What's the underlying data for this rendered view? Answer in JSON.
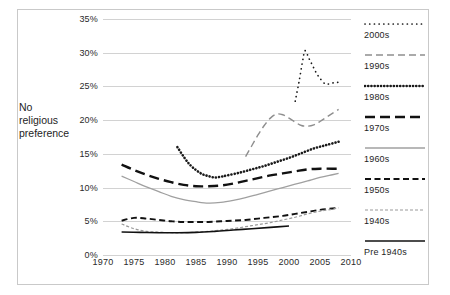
{
  "axis_title": [
    "No",
    "religious",
    "preference"
  ],
  "chart_data": {
    "type": "line",
    "title": "",
    "xlabel": "",
    "ylabel": "No religious preference",
    "xlim": [
      1970,
      2010
    ],
    "ylim": [
      0,
      35
    ],
    "xticks": [
      "1970",
      "1975",
      "1980",
      "1985",
      "1990",
      "1995",
      "2000",
      "2005",
      "2010"
    ],
    "yticks": [
      "0%",
      "5%",
      "10%",
      "15%",
      "20%",
      "25%",
      "30%",
      "35%"
    ],
    "grid": true,
    "legend_position": "right",
    "series": [
      {
        "name": "2000s",
        "style": "fine-dotted",
        "color": "#1a1a1a",
        "x": [
          2001,
          2001.6,
          2002.2,
          2002.6,
          2003.2,
          2003.8,
          2004.4,
          2005,
          2005.8,
          2006.6,
          2007.4,
          2008
        ],
        "y": [
          22.8,
          25.6,
          28.8,
          30.3,
          29.2,
          28.1,
          27.0,
          26.2,
          25.4,
          25.4,
          25.6,
          25.6
        ]
      },
      {
        "name": "1990s",
        "style": "long-dash-gray",
        "color": "#8e8e8e",
        "x": [
          1993,
          1994,
          1995,
          1996,
          1997,
          1998,
          1999,
          2000,
          2001,
          2002,
          2003,
          2004,
          2005,
          2006,
          2007,
          2008
        ],
        "y": [
          14.6,
          16.2,
          17.8,
          19.2,
          20.3,
          20.9,
          20.8,
          20.3,
          19.7,
          19.2,
          19.1,
          19.3,
          19.8,
          20.4,
          21.0,
          21.6
        ]
      },
      {
        "name": "1980s",
        "style": "bold-dotted",
        "color": "#1a1a1a",
        "x": [
          1982,
          1983,
          1984,
          1985,
          1986,
          1987,
          1988,
          1989,
          1990,
          1992,
          1994,
          1996,
          1998,
          2000,
          2002,
          2004,
          2006,
          2008
        ],
        "y": [
          16.0,
          14.6,
          13.4,
          12.6,
          12.0,
          11.7,
          11.5,
          11.6,
          11.8,
          12.2,
          12.7,
          13.2,
          13.8,
          14.4,
          15.1,
          15.8,
          16.3,
          16.8
        ]
      },
      {
        "name": "1970s",
        "style": "long-dash-black",
        "color": "#111111",
        "x": [
          1973,
          1975,
          1977,
          1979,
          1981,
          1983,
          1985,
          1987,
          1989,
          1991,
          1993,
          1995,
          1997,
          1999,
          2001,
          2003,
          2005,
          2007,
          2008
        ],
        "y": [
          13.4,
          12.6,
          11.9,
          11.3,
          10.8,
          10.4,
          10.2,
          10.2,
          10.3,
          10.6,
          11.0,
          11.4,
          11.8,
          12.1,
          12.4,
          12.7,
          12.8,
          12.8,
          12.8
        ]
      },
      {
        "name": "1960s",
        "style": "thin-solid-gray",
        "color": "#a0a0a0",
        "x": [
          1973,
          1975,
          1977,
          1979,
          1981,
          1983,
          1985,
          1987,
          1989,
          1991,
          1993,
          1995,
          1997,
          1999,
          2001,
          2003,
          2005,
          2007,
          2008
        ],
        "y": [
          11.7,
          10.9,
          10.1,
          9.4,
          8.7,
          8.2,
          7.9,
          7.7,
          7.8,
          8.1,
          8.5,
          9.0,
          9.5,
          10.0,
          10.5,
          11.0,
          11.5,
          11.9,
          12.1
        ]
      },
      {
        "name": "1950s",
        "style": "med-dash-black",
        "color": "#111111",
        "x": [
          1973,
          1975,
          1977,
          1979,
          1981,
          1983,
          1985,
          1987,
          1989,
          1991,
          1993,
          1995,
          1997,
          1999,
          2001,
          2003,
          2005,
          2007,
          2008
        ],
        "y": [
          5.1,
          5.5,
          5.4,
          5.2,
          5.0,
          4.9,
          4.9,
          4.9,
          5.0,
          5.1,
          5.2,
          5.4,
          5.6,
          5.8,
          6.1,
          6.4,
          6.7,
          6.9,
          7.0
        ]
      },
      {
        "name": "1940s",
        "style": "fine-dash-gray",
        "color": "#9a9a9a",
        "x": [
          1973,
          1975,
          1977,
          1979,
          1981,
          1983,
          1985,
          1987,
          1989,
          1991,
          1993,
          1995,
          1997,
          1999,
          2001,
          2003,
          2005,
          2007,
          2008
        ],
        "y": [
          4.6,
          3.9,
          3.5,
          3.4,
          3.3,
          3.3,
          3.4,
          3.5,
          3.7,
          3.9,
          4.2,
          4.5,
          4.8,
          5.2,
          5.6,
          6.1,
          6.5,
          6.8,
          7.0
        ]
      },
      {
        "name": "Pre 1940s",
        "style": "thin-solid-black",
        "color": "#111111",
        "x": [
          1973,
          1976,
          1979,
          1982,
          1985,
          1988,
          1991,
          1994,
          1997,
          2000
        ],
        "y": [
          3.4,
          3.35,
          3.3,
          3.3,
          3.35,
          3.5,
          3.7,
          3.9,
          4.1,
          4.3
        ]
      }
    ]
  },
  "legend": {
    "items": [
      {
        "label": "2000s",
        "style": "fine-dotted"
      },
      {
        "label": "1990s",
        "style": "long-dash-gray"
      },
      {
        "label": "1980s",
        "style": "bold-dotted"
      },
      {
        "label": "1970s",
        "style": "long-dash-black"
      },
      {
        "label": "1960s",
        "style": "thin-solid-gray"
      },
      {
        "label": "1950s",
        "style": "med-dash-black"
      },
      {
        "label": "1940s",
        "style": "fine-dash-gray"
      },
      {
        "label": "Pre 1940s",
        "style": "thin-solid-black"
      }
    ]
  }
}
